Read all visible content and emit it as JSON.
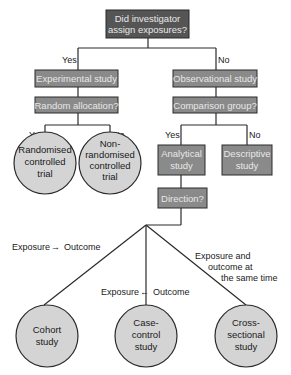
{
  "diagram": {
    "title_question": [
      "Did investigator",
      "assign exposures?"
    ],
    "branches": {
      "left_label": "Yes",
      "right_label": "No"
    },
    "experimental": {
      "box": "Experimental study",
      "question": "Random allocation?",
      "yes_label": "Yes",
      "no_label": "No",
      "outcomes": [
        {
          "lines": [
            "Randomised",
            "controlled",
            "trial"
          ]
        },
        {
          "lines": [
            "Non-",
            "randomised",
            "controlled",
            "trial"
          ]
        }
      ]
    },
    "observational": {
      "box": "Observational study",
      "question": "Comparison group?",
      "yes_label": "Yes",
      "no_label": "No",
      "analytical": [
        "Analytical",
        "study"
      ],
      "descriptive": [
        "Descriptive",
        "study"
      ],
      "direction": "Direction?"
    },
    "directions": {
      "forward": {
        "left": "Exposure",
        "arrow": "→",
        "right": "Outcome"
      },
      "backward": {
        "left": "Exposure",
        "arrow": "←",
        "right": "Outcome"
      },
      "simultaneous": [
        "Exposure and",
        "outcome at",
        "the same time"
      ]
    },
    "designs": [
      {
        "lines": [
          "Cohort",
          "study"
        ]
      },
      {
        "lines": [
          "Case-",
          "control",
          "study"
        ]
      },
      {
        "lines": [
          "Cross-",
          "sectional",
          "study"
        ]
      }
    ],
    "colors": {
      "dark_box": "#555555",
      "mid_box": "#8a8a8a",
      "circle_fill": "#d4d4d4",
      "stroke": "#2a2a2a"
    }
  }
}
